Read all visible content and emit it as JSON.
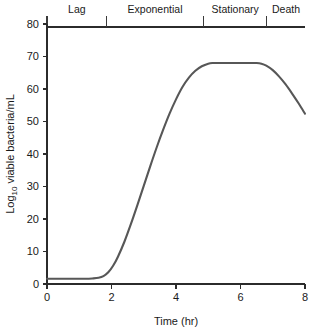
{
  "chart_data": {
    "type": "line",
    "title": "",
    "xlabel": "Time (hr)",
    "ylabel": "Log10 viable bacteria/mL",
    "ylabel_main": "Log",
    "ylabel_sub": "10",
    "ylabel_rest": " viable bacteria/mL",
    "xlim": [
      0,
      8
    ],
    "ylim": [
      0,
      80
    ],
    "grid": false,
    "legend": "none",
    "xticks": [
      0,
      2,
      4,
      6,
      8
    ],
    "xtick_labels": [
      "0",
      "2",
      "4",
      "6",
      "8"
    ],
    "yticks": [
      0,
      10,
      20,
      30,
      40,
      50,
      60,
      70,
      80
    ],
    "ytick_labels": [
      "0",
      "10",
      "20",
      "30",
      "40",
      "50",
      "60",
      "70",
      "80"
    ],
    "series": [
      {
        "name": "viable bacteria",
        "color": "#575757",
        "x": [
          0.0,
          0.2,
          0.4,
          0.6,
          0.8,
          1.0,
          1.2,
          1.4,
          1.6,
          1.75,
          1.9,
          2.05,
          2.2,
          2.4,
          2.6,
          2.8,
          3.0,
          3.2,
          3.4,
          3.6,
          3.8,
          4.0,
          4.2,
          4.4,
          4.6,
          4.8,
          5.0,
          5.15,
          5.3,
          5.6,
          5.9,
          6.2,
          6.5,
          6.65,
          6.8,
          7.0,
          7.2,
          7.4,
          7.6,
          7.8,
          8.0
        ],
        "y": [
          1.6,
          1.6,
          1.6,
          1.6,
          1.6,
          1.6,
          1.6,
          1.7,
          1.9,
          2.4,
          3.6,
          5.6,
          8.4,
          13.0,
          18.4,
          24.2,
          30.2,
          36.2,
          42.0,
          47.4,
          52.4,
          56.8,
          60.6,
          63.5,
          65.6,
          67.0,
          67.8,
          68.0,
          68.0,
          68.0,
          68.0,
          68.0,
          68.0,
          67.8,
          67.2,
          65.8,
          63.8,
          61.4,
          58.6,
          55.6,
          52.4
        ]
      }
    ],
    "phases": [
      {
        "label": "Lag",
        "start": 0.0,
        "end": 1.85
      },
      {
        "label": "Exponential",
        "start": 1.85,
        "end": 4.85
      },
      {
        "label": "Stationary",
        "start": 4.85,
        "end": 6.82
      },
      {
        "label": "Death",
        "start": 6.82,
        "end": 8.0
      }
    ],
    "phase_dividers": [
      1.85,
      4.85,
      6.82
    ],
    "colors": {
      "curve": "#575757",
      "axis": "#2b2b2b",
      "background": "#ffffff",
      "text": "#1a1a1a"
    }
  }
}
